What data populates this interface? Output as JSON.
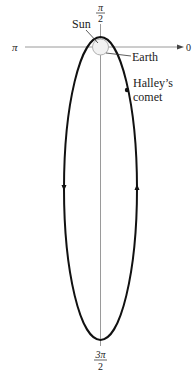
{
  "diagram": {
    "axis_labels": {
      "right": "0",
      "top_num": "π",
      "top_den": "2",
      "left": "π",
      "bottom_num": "3π",
      "bottom_den": "2"
    },
    "annotations": {
      "sun": "Sun",
      "earth": "Earth",
      "comet_line1": "Halley’s",
      "comet_line2": "comet"
    },
    "colors": {
      "orbit": "#111111",
      "axis": "#9a9a9a",
      "earth_orbit": "#b0b0b0",
      "text": "#222222"
    }
  }
}
